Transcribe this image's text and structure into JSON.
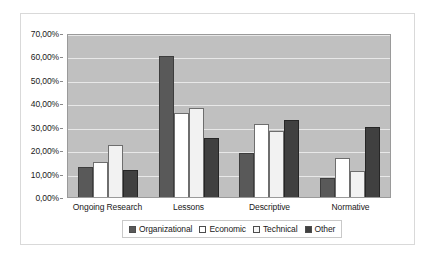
{
  "chart_data": {
    "type": "bar",
    "title": "",
    "xlabel": "",
    "ylabel": "",
    "categories": [
      "Ongoing Research",
      "Lessons",
      "Descriptive",
      "Normative"
    ],
    "series": [
      {
        "name": "Organizational",
        "color": "#595959",
        "values": [
          13.0,
          60.0,
          19.0,
          8.0
        ]
      },
      {
        "name": "Economic",
        "color": "#ffffff",
        "values": [
          15.0,
          36.0,
          31.0,
          16.5
        ]
      },
      {
        "name": "Technical",
        "color": "#f2f2f2",
        "values": [
          22.0,
          38.0,
          28.0,
          11.0
        ]
      },
      {
        "name": "Other",
        "color": "#404040",
        "values": [
          11.5,
          25.0,
          33.0,
          30.0
        ]
      }
    ],
    "ylim": [
      0,
      70
    ],
    "y_tick_values": [
      0,
      10,
      20,
      30,
      40,
      50,
      60,
      70
    ],
    "y_tick_labels": [
      "0,00%",
      "10,00%",
      "20,00%",
      "30,00%",
      "40,00%",
      "50,00%",
      "60,00%",
      "70,00%"
    ],
    "grid": true,
    "legend_position": "bottom",
    "plot_background": "#c0c0c0",
    "gridline_color": "#e8e8e8"
  }
}
